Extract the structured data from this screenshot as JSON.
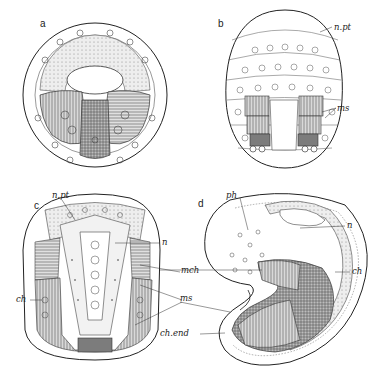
{
  "figure": {
    "panels": [
      {
        "id": "a",
        "letter": "a",
        "labels": []
      },
      {
        "id": "b",
        "letter": "b",
        "labels": [
          {
            "text": "n.pt",
            "meaning": "neural plate"
          },
          {
            "text": "ms",
            "meaning": "mesoderm"
          }
        ]
      },
      {
        "id": "c",
        "letter": "c",
        "labels": [
          {
            "text": "n.pt"
          },
          {
            "text": "n"
          },
          {
            "text": "mch"
          },
          {
            "text": "ms"
          },
          {
            "text": "ch"
          }
        ]
      },
      {
        "id": "d",
        "letter": "d",
        "labels": [
          {
            "text": "ph"
          },
          {
            "text": "n"
          },
          {
            "text": "ch"
          },
          {
            "text": "ch.end"
          }
        ]
      }
    ],
    "colors": {
      "ink": "#222222",
      "shade_light": "#e6e6e6",
      "shade_mid": "#bdbdbd",
      "shade_dark": "#8a8a8a",
      "background": "#ffffff"
    }
  }
}
